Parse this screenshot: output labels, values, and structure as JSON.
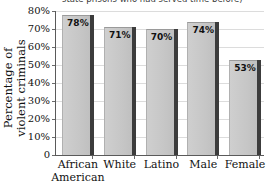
{
  "chart_data": {
    "type": "bar",
    "title": "state prisons who had served time before)",
    "xlabel": "",
    "ylabel": "Percentage of violent criminals",
    "ylabel_line1": "Percentage of",
    "ylabel_line2": "violent criminals",
    "categories": [
      "African American",
      "White",
      "Latino",
      "Male",
      "Female"
    ],
    "category_lines": [
      {
        "line1": "African",
        "line2": "American"
      },
      {
        "line1": "White",
        "line2": ""
      },
      {
        "line1": "Latino",
        "line2": ""
      },
      {
        "line1": "Male",
        "line2": ""
      },
      {
        "line1": "Female",
        "line2": ""
      }
    ],
    "values": [
      78,
      71,
      70,
      74,
      53
    ],
    "value_labels": [
      "78%",
      "71%",
      "70%",
      "74%",
      "53%"
    ],
    "ylim": [
      0,
      80
    ],
    "ytick_values": [
      0,
      10,
      20,
      30,
      40,
      50,
      60,
      70,
      80
    ],
    "ytick_labels": [
      "0",
      "10%",
      "20%",
      "30%",
      "40%",
      "50%",
      "60%",
      "70%",
      "80%"
    ],
    "grid": true,
    "legend": "none",
    "colors": {
      "bar_fill": "#c9c9c9",
      "bar_shadow": "#3c3c3c",
      "gridline": "#dcdcdc",
      "axis": "#5a5a5a",
      "text": "#111111",
      "background": "#ffffff"
    }
  }
}
